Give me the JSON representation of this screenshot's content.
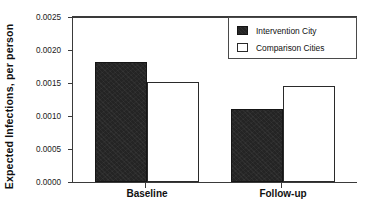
{
  "chart_data": {
    "type": "bar",
    "title": "",
    "xlabel": "",
    "ylabel": "Expected Infections,  per person",
    "categories": [
      "Baseline",
      "Follow-up"
    ],
    "series": [
      {
        "name": "Intervention City",
        "values": [
          0.0018,
          0.0011
        ],
        "color": "#242424",
        "fill": "solid-dark"
      },
      {
        "name": "Comparison Cities",
        "values": [
          0.0015,
          0.00145
        ],
        "color": "#ffffff",
        "fill": "open-white"
      }
    ],
    "ylim": [
      0.0,
      0.0025
    ],
    "yticks": [
      0.0,
      0.0005,
      0.001,
      0.0015,
      0.002,
      0.0025
    ],
    "ytick_labels": [
      "0.0000",
      "0.0005",
      "0.0010",
      "0.0015",
      "0.0020",
      "0.0025"
    ],
    "grid": false,
    "legend_position": "top-right"
  },
  "axis": {
    "y_title": "Expected Infections,  per person",
    "tick_labels": [
      "0.0025",
      "0.0020",
      "0.0015",
      "0.0010",
      "0.0005",
      "0.0000"
    ],
    "category_labels": [
      "Baseline",
      "Follow-up"
    ]
  },
  "legend": {
    "entries": [
      {
        "label": "Intervention City",
        "swatch": "filled-dark-square"
      },
      {
        "label": "Comparison Cities",
        "swatch": "open-white-square"
      }
    ]
  },
  "colors": {
    "intervention": "#242424",
    "comparison": "#ffffff",
    "axis": "#3a3a3a",
    "background": "#ffffff"
  }
}
